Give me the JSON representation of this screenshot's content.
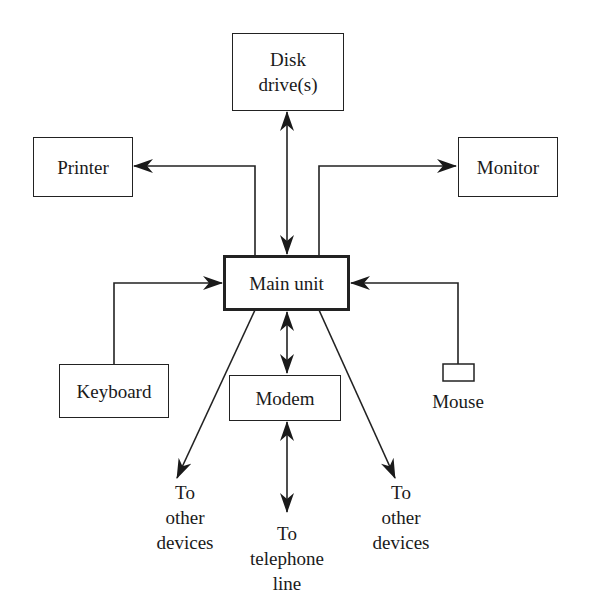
{
  "diagram": {
    "title": "",
    "nodes": {
      "disk": {
        "label_line1": "Disk",
        "label_line2": "drive(s)"
      },
      "printer": {
        "label": "Printer"
      },
      "monitor": {
        "label": "Monitor"
      },
      "main": {
        "label": "Main unit"
      },
      "keyboard": {
        "label": "Keyboard"
      },
      "modem": {
        "label": "Modem"
      },
      "mouse": {
        "label": "Mouse"
      }
    },
    "terminals": {
      "other_left": {
        "line1": "To",
        "line2": "other",
        "line3": "devices"
      },
      "telephone": {
        "line1": "To",
        "line2": "telephone",
        "line3": "line"
      },
      "other_right": {
        "line1": "To",
        "line2": "other",
        "line3": "devices"
      }
    },
    "edges": [
      {
        "from": "main",
        "to": "disk",
        "direction": "bidirectional"
      },
      {
        "from": "main",
        "to": "printer",
        "direction": "forward"
      },
      {
        "from": "main",
        "to": "monitor",
        "direction": "forward"
      },
      {
        "from": "keyboard",
        "to": "main",
        "direction": "forward"
      },
      {
        "from": "mouse",
        "to": "main",
        "direction": "forward"
      },
      {
        "from": "main",
        "to": "modem",
        "direction": "bidirectional"
      },
      {
        "from": "modem",
        "to": "telephone",
        "direction": "bidirectional"
      },
      {
        "from": "main",
        "to": "other_left",
        "direction": "forward"
      },
      {
        "from": "main",
        "to": "other_right",
        "direction": "forward"
      }
    ],
    "colors": {
      "stroke": "#222222",
      "background": "#ffffff"
    }
  }
}
